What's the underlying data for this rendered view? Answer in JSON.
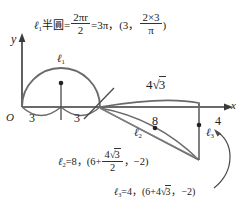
{
  "figure": {
    "type": "geometry-diagram",
    "axes": {
      "y_label": "y",
      "x_label": "x",
      "origin_label": "O"
    },
    "formulas": {
      "top": {
        "lhs_curve": "ℓ",
        "lhs_sub": "1",
        "word": "半圓",
        "eq1": "=",
        "frac_num": "2πr",
        "frac_den": "2",
        "eq2": "=3π",
        "comma1": "，",
        "paren_open": "(3",
        "comma2": "，",
        "frac2_num": "2×3",
        "frac2_den": "π",
        "paren_close": ")"
      },
      "l2": {
        "sym": "ℓ",
        "sub": "2",
        "eq": "=8",
        "comma1": "，",
        "paren_open": "(6+",
        "frac_num_a": "4",
        "frac_num_rad": "3",
        "frac_den": "2",
        "comma2": "，",
        "value": "−2",
        "paren_close": ")"
      },
      "l3": {
        "sym": "ℓ",
        "sub": "3",
        "eq": "=4",
        "comma1": "，",
        "paren_open": "(6+4",
        "rad": "3",
        "comma2": "，",
        "value": "−2",
        "paren_close": ")"
      }
    },
    "curve_labels": [
      {
        "name": "l1",
        "sym": "ℓ",
        "sub": "1"
      },
      {
        "name": "l2",
        "sym": "ℓ",
        "sub": "2"
      },
      {
        "name": "l3",
        "sym": "ℓ",
        "sub": "3"
      }
    ],
    "measurements": {
      "seg_left": "3",
      "seg_right": "3",
      "seg_diag": "8",
      "seg_vertical": "4",
      "seg_top_a": "4",
      "seg_top_rad": "3"
    },
    "colors": {
      "stroke": "#555555",
      "axis": "#3a3a3a",
      "text": "#222222"
    }
  }
}
